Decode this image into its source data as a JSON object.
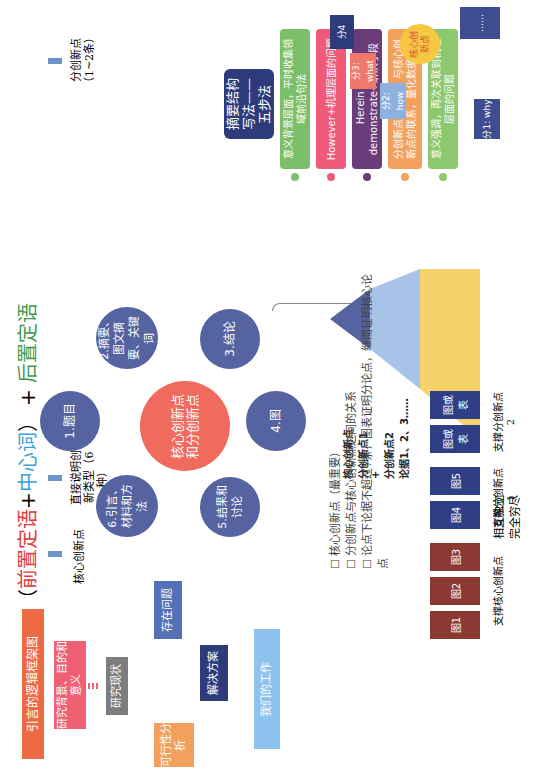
{
  "intro_framework": {
    "title": "引言的逻辑框架图",
    "nodes": {
      "background": "研究背景、目的和意义",
      "status": "研究现状",
      "problems": "存在问题",
      "solution": "解决方案",
      "feasibility": "可行性分析",
      "our_work": "我们的工作"
    },
    "colors": {
      "title": "#ee6a45",
      "background": "#ef6072",
      "status": "#7d7d7d",
      "problems": "#5670b5",
      "solution": "#2e3b7a",
      "feasibility": "#f2a15c",
      "our_work": "#8ec2ee"
    }
  },
  "hub": {
    "center": "核心创新点和分创新点",
    "center_color": "#f06a5e",
    "satellites": [
      {
        "id": "title",
        "label": "1.题目"
      },
      {
        "id": "abstract",
        "label": "2.摘要、图文摘要、关键词"
      },
      {
        "id": "conclusion",
        "label": "3.结论"
      },
      {
        "id": "figures",
        "label": "4.图"
      },
      {
        "id": "results",
        "label": "5.结果和讨论"
      },
      {
        "id": "intro",
        "label": "6.引言、材料和方法"
      }
    ],
    "satellite_color": "#5563a0"
  },
  "title_formula": {
    "open_paren": "（",
    "pre_modifier": "前置定语",
    "plus1": "+",
    "head_word": "中心词",
    "close_paren": "）",
    "plus2": "+",
    "post_modifier": "后置定语",
    "maps": [
      {
        "from": "前置定语",
        "to": "核心创新点"
      },
      {
        "from": "中心词",
        "to": "直接说明创新类型（6种）"
      },
      {
        "from": "后置定语",
        "to": "分创新点（1~2条）"
      }
    ],
    "colors": {
      "pre": "#e23b3b",
      "head": "#3aa0d8",
      "post": "#3f9a4e",
      "arrow": "#6b95c6"
    }
  },
  "abstract_method": {
    "title": "摘要结构写法——五步法",
    "title_color": "#2e3b7a",
    "steps": [
      {
        "text": "意义背景层面，平时收集领域前沿句法",
        "color": "#7cbf6a"
      },
      {
        "text": "However+机理层面的问题",
        "color": "#ef5a78"
      },
      {
        "text": "Herein we demonstrate+解决手段",
        "color": "#6a3d7a"
      },
      {
        "text": "分创新点是什么，与核心创新点的联系，量化数据给出",
        "color": "#f2a15c"
      },
      {
        "text": "意义强调，再次关联到机理层面的问题",
        "color": "#8cc86e"
      }
    ]
  },
  "core_point_diagram": {
    "center": "核心创新点",
    "center_color": "#f5c842",
    "parts": [
      {
        "label": "分1: why",
        "color": "#3d4d8f"
      },
      {
        "label": "分2: how",
        "color": "#8eb2df"
      },
      {
        "label": "分3: what",
        "color": "#f0786a"
      },
      {
        "label": "分4",
        "color": "#2e3b7a"
      },
      {
        "label": "……",
        "color": "#3d4d8f"
      }
    ]
  },
  "pyramid": {
    "levels": [
      {
        "text": "核心创新点",
        "color": "#5563a0"
      },
      {
        "text": "分创新点1",
        "color": "#a9c3e8"
      },
      {
        "text": "+",
        "color": "#f6d26b"
      },
      {
        "text": "分创新点2",
        "color": "#f6d26b"
      },
      {
        "text": "论据1、2、3……",
        "color": "#f06a5e"
      }
    ],
    "side_note": "相互独立完全穷尽"
  },
  "checklist": [
    {
      "text": "核心创新点（最重要）"
    },
    {
      "text": "分创新点与核心创新点之间的关系"
    },
    {
      "text": "论点下论据不超过7条，图表证明分论点，继而证明核心论点"
    }
  ],
  "figure_groups": [
    {
      "figs": [
        "图1",
        "图2",
        "图3"
      ],
      "color": "#8b3a33",
      "caption": "支撑核心创新点"
    },
    {
      "figs": [
        "图4",
        "图5"
      ],
      "color": "#2f3f86",
      "caption": "支撑分创新点1"
    },
    {
      "figs": [
        "图或表",
        "图或表"
      ],
      "color": "#2f3f86",
      "caption": "支撑分创新点2"
    }
  ]
}
